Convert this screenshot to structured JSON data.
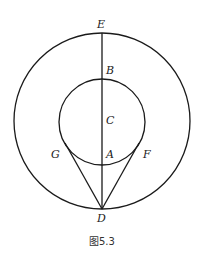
{
  "figure": {
    "caption": "图5.3",
    "stroke_color": "#1a1a1a",
    "outer_circle": {
      "cx": 102,
      "cy": 121,
      "r": 88
    },
    "inner_circle": {
      "cx": 102,
      "cy": 122,
      "r": 43
    },
    "points": {
      "E": {
        "label": "E",
        "x": 102,
        "y": 33
      },
      "B": {
        "label": "B",
        "x": 102,
        "y": 79
      },
      "C": {
        "label": "C",
        "x": 102,
        "y": 122
      },
      "A": {
        "label": "A",
        "x": 102,
        "y": 165
      },
      "G": {
        "label": "G",
        "x": 65,
        "y": 143
      },
      "F": {
        "label": "F",
        "x": 139,
        "y": 143
      },
      "D": {
        "label": "D",
        "x": 102,
        "y": 209
      }
    },
    "segments": [
      "E-D",
      "G-D",
      "F-D"
    ]
  }
}
